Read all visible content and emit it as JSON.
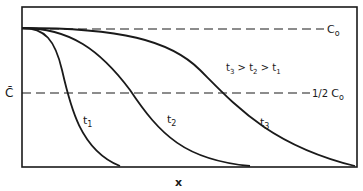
{
  "diagram": {
    "y_axis_label": "C̄",
    "x_axis_label": "x",
    "reference_lines": [
      {
        "label_main": "C",
        "label_sub": "o",
        "name": "C0"
      },
      {
        "label_prefix": "1/2 ",
        "label_main": "C",
        "label_sub": "o",
        "name": "half-C0"
      }
    ],
    "curves": [
      {
        "label_main": "t",
        "label_sub": "1"
      },
      {
        "label_main": "t",
        "label_sub": "2"
      },
      {
        "label_main": "t",
        "label_sub": "3"
      }
    ],
    "annotation": {
      "t3": "t",
      "s3": "3",
      "gt1": " > ",
      "t2": "t",
      "s2": "2",
      "gt2": " > ",
      "t1": "t",
      "s1": "1"
    },
    "colors": {
      "ink": "#1a1a1a",
      "background": "#ffffff"
    }
  }
}
